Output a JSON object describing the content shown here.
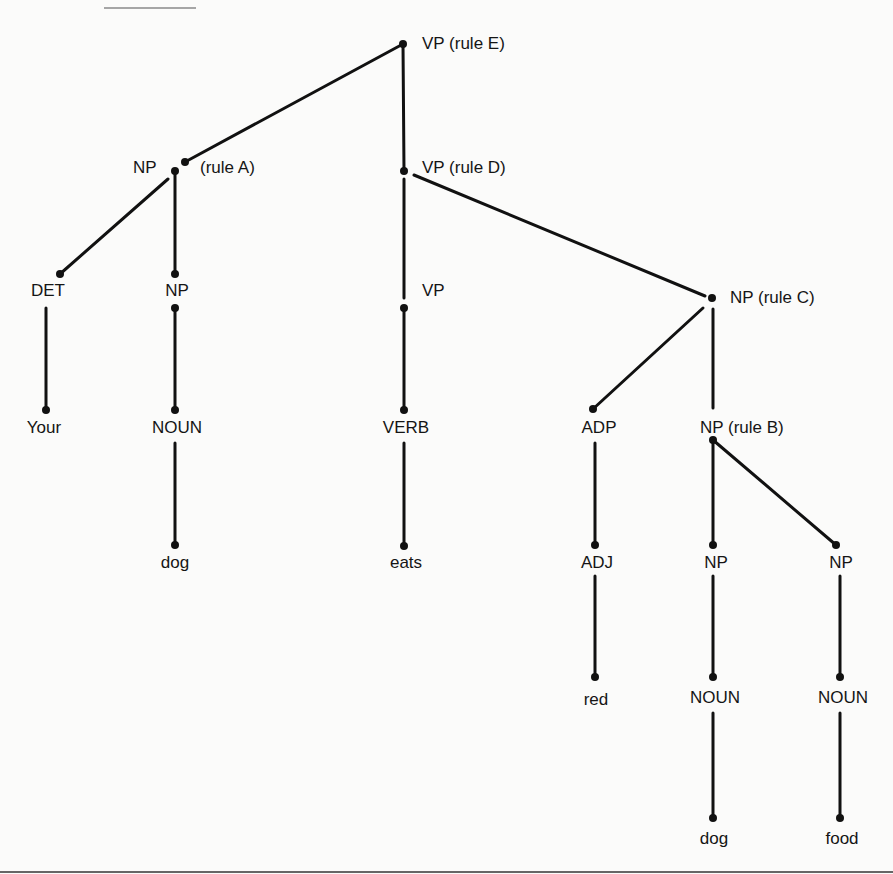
{
  "diagram": {
    "type": "parse-tree",
    "sentence": [
      "Your",
      "dog",
      "eats",
      "red",
      "dog",
      "food"
    ],
    "nodes": {
      "vp_e": {
        "label": "VP (rule E)"
      },
      "np_a": {
        "label": "NP",
        "rule": "(rule A)"
      },
      "vp_d": {
        "label": "VP (rule D)"
      },
      "det": {
        "label": "DET"
      },
      "np_1": {
        "label": "NP"
      },
      "vp_1": {
        "label": "VP"
      },
      "np_c": {
        "label": "NP (rule C)"
      },
      "your": {
        "label": "Your"
      },
      "noun_1": {
        "label": "NOUN"
      },
      "verb": {
        "label": "VERB"
      },
      "adp": {
        "label": "ADP"
      },
      "np_b": {
        "label": "NP (rule B)"
      },
      "dog_1": {
        "label": "dog"
      },
      "eats": {
        "label": "eats"
      },
      "adj": {
        "label": "ADJ"
      },
      "np_2": {
        "label": "NP"
      },
      "np_3": {
        "label": "NP"
      },
      "red": {
        "label": "red"
      },
      "noun_2": {
        "label": "NOUN"
      },
      "noun_3": {
        "label": "NOUN"
      },
      "dog_2": {
        "label": "dog"
      },
      "food": {
        "label": "food"
      }
    },
    "edges": [
      [
        "vp_e",
        "np_a"
      ],
      [
        "vp_e",
        "vp_d"
      ],
      [
        "np_a",
        "det"
      ],
      [
        "np_a",
        "np_1"
      ],
      [
        "det",
        "your"
      ],
      [
        "np_1",
        "noun_1"
      ],
      [
        "noun_1",
        "dog_1"
      ],
      [
        "vp_d",
        "vp_1"
      ],
      [
        "vp_d",
        "np_c"
      ],
      [
        "vp_1",
        "verb"
      ],
      [
        "verb",
        "eats"
      ],
      [
        "np_c",
        "adp"
      ],
      [
        "np_c",
        "np_b"
      ],
      [
        "adp",
        "adj"
      ],
      [
        "adj",
        "red"
      ],
      [
        "np_b",
        "np_2"
      ],
      [
        "np_b",
        "np_3"
      ],
      [
        "np_2",
        "noun_2"
      ],
      [
        "noun_2",
        "dog_2"
      ],
      [
        "np_3",
        "noun_3"
      ],
      [
        "noun_3",
        "food"
      ]
    ],
    "colors": {
      "background": "#fbfbfa",
      "ink": "#111111",
      "rule": "#777777"
    }
  }
}
